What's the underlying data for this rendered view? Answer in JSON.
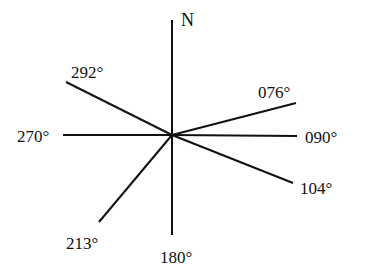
{
  "diagram": {
    "type": "bearing-diagram",
    "north_label": "N",
    "center": [
      172,
      135
    ],
    "line_color": "#111111",
    "bearings": [
      {
        "label": "076°",
        "degrees": 76,
        "end": [
          296,
          103
        ],
        "label_pos": [
          258,
          84
        ]
      },
      {
        "label": "090°",
        "degrees": 90,
        "end": [
          297,
          136
        ],
        "label_pos": [
          305,
          129
        ]
      },
      {
        "label": "104°",
        "degrees": 104,
        "end": [
          293,
          183
        ],
        "label_pos": [
          300,
          180
        ]
      },
      {
        "label": "180°",
        "degrees": 180,
        "end": [
          172,
          235
        ],
        "label_pos": [
          160,
          249
        ]
      },
      {
        "label": "213°",
        "degrees": 213,
        "end": [
          99,
          222
        ],
        "label_pos": [
          66,
          235
        ]
      },
      {
        "label": "270°",
        "degrees": 270,
        "end": [
          63,
          135
        ],
        "label_pos": [
          17,
          128
        ]
      },
      {
        "label": "292°",
        "degrees": 292,
        "end": [
          66,
          82
        ],
        "label_pos": [
          71,
          64
        ]
      }
    ],
    "north_line_end": [
      172,
      20
    ],
    "north_label_pos": [
      181,
      11
    ]
  }
}
